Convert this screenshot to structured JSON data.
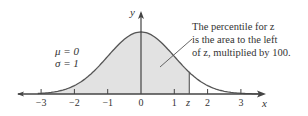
{
  "figure": {
    "type": "standard normal distribution curve",
    "params": {
      "mu_label": "μ = 0",
      "sigma_label": "σ = 1"
    },
    "axes": {
      "x_label": "x",
      "y_label": "y"
    },
    "x_ticks": [
      {
        "value": -3,
        "label": "−3"
      },
      {
        "value": -2,
        "label": "−2"
      },
      {
        "value": -1,
        "label": "−1"
      },
      {
        "value": 0,
        "label": "0"
      },
      {
        "value": 1,
        "label": "1"
      },
      {
        "value": 2,
        "label": "2"
      },
      {
        "value": 3,
        "label": "3"
      }
    ],
    "z_marker": {
      "label": "z",
      "approx_value": 1.45
    },
    "annotation": {
      "line1": "The percentile for z",
      "line2": "is the area to the left",
      "line3": "of z, multiplied by 100."
    },
    "colors": {
      "curve": "#555555",
      "shade": "#e2e2e2",
      "axis": "#444444",
      "text": "#333333"
    }
  }
}
